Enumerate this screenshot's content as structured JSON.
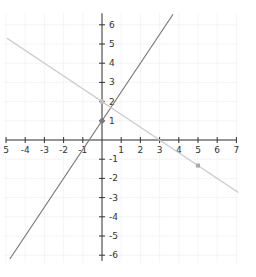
{
  "chart_data": {
    "type": "line",
    "title": "",
    "xlabel": "",
    "ylabel": "",
    "xlim": [
      -5,
      7
    ],
    "ylim": [
      -6,
      6
    ],
    "grid": true,
    "x_ticks": [
      "5",
      "-4",
      "-3",
      "-2",
      "-1",
      "1",
      "2",
      "3",
      "4",
      "5",
      "6",
      "7"
    ],
    "y_ticks": [
      "6",
      "5",
      "4",
      "3",
      "2",
      "1",
      "-1",
      "-2",
      "-3",
      "-4",
      "-5",
      "-6"
    ],
    "series": [
      {
        "name": "line-1",
        "equation": "y = 1.5x + 1",
        "color": "#7a7a7a",
        "x": [
          -4.8,
          3.7
        ],
        "y": [
          -6.2,
          6.55
        ]
      },
      {
        "name": "line-2",
        "equation": "y = -2/3 x + 2",
        "color": "#c8c8c8",
        "x": [
          -4.95,
          7.1
        ],
        "y": [
          5.3,
          -2.73
        ]
      }
    ],
    "points": [
      {
        "x": 0,
        "y": 1,
        "color": "#7a7a7a"
      },
      {
        "x": 0,
        "y": 2,
        "color": "#c0c0c0"
      },
      {
        "x": 5,
        "y": -1.33,
        "color": "#aaaaaa"
      }
    ]
  }
}
